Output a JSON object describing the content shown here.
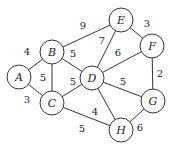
{
  "graph": {
    "type": "weighted-undirected",
    "nodes": [
      {
        "id": "A",
        "label": "A",
        "x": 19,
        "y": 77
      },
      {
        "id": "B",
        "label": "B",
        "x": 52,
        "y": 52
      },
      {
        "id": "C",
        "label": "C",
        "x": 52,
        "y": 103
      },
      {
        "id": "D",
        "label": "D",
        "x": 92,
        "y": 78
      },
      {
        "id": "E",
        "label": "E",
        "x": 121,
        "y": 20
      },
      {
        "id": "F",
        "label": "F",
        "x": 152,
        "y": 46
      },
      {
        "id": "G",
        "label": "G",
        "x": 153,
        "y": 101
      },
      {
        "id": "H",
        "label": "H",
        "x": 121,
        "y": 130
      }
    ],
    "edges": [
      {
        "from": "A",
        "to": "B",
        "weight": "4",
        "lx": 27,
        "ly": 51
      },
      {
        "from": "A",
        "to": "C",
        "weight": "3",
        "lx": 27,
        "ly": 99
      },
      {
        "from": "B",
        "to": "C",
        "weight": "5",
        "lx": 43,
        "ly": 77
      },
      {
        "from": "B",
        "to": "D",
        "weight": "5",
        "lx": 73,
        "ly": 53
      },
      {
        "from": "B",
        "to": "E",
        "weight": "9",
        "lx": 83,
        "ly": 25
      },
      {
        "from": "C",
        "to": "D",
        "weight": "5",
        "lx": 73,
        "ly": 81
      },
      {
        "from": "C",
        "to": "H",
        "weight": "5",
        "lx": 82,
        "ly": 128
      },
      {
        "from": "D",
        "to": "E",
        "weight": "7",
        "lx": 102,
        "ly": 40
      },
      {
        "from": "D",
        "to": "F",
        "weight": "6",
        "lx": 118,
        "ly": 52
      },
      {
        "from": "D",
        "to": "G",
        "weight": "5",
        "lx": 123,
        "ly": 81
      },
      {
        "from": "D",
        "to": "H",
        "weight": "4",
        "lx": 95,
        "ly": 111
      },
      {
        "from": "E",
        "to": "F",
        "weight": "3",
        "lx": 147,
        "ly": 23
      },
      {
        "from": "F",
        "to": "G",
        "weight": "2",
        "lx": 160,
        "ly": 73
      },
      {
        "from": "G",
        "to": "H",
        "weight": "6",
        "lx": 140,
        "ly": 127
      }
    ],
    "node_radius": 12,
    "colors": {
      "stroke": "#333333",
      "fill": "#ffffff",
      "text": "#222222"
    }
  }
}
